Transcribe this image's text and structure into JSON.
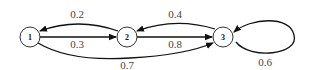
{
  "diagram": {
    "type": "markov-chain-state-diagram",
    "nodes": [
      {
        "id": "1",
        "label": "1",
        "cx": 30,
        "cy": 37
      },
      {
        "id": "2",
        "label": "2",
        "cx": 127,
        "cy": 37
      },
      {
        "id": "3",
        "label": "3",
        "cx": 223,
        "cy": 37
      }
    ],
    "edges": [
      {
        "from": "2",
        "to": "1",
        "label": "0.2"
      },
      {
        "from": "1",
        "to": "2",
        "label": "0.3"
      },
      {
        "from": "3",
        "to": "2",
        "label": "0.4"
      },
      {
        "from": "2",
        "to": "3",
        "label": "0.8"
      },
      {
        "from": "1",
        "to": "3",
        "label": "0.7"
      },
      {
        "from": "3",
        "to": "3",
        "label": "0.6"
      }
    ]
  }
}
